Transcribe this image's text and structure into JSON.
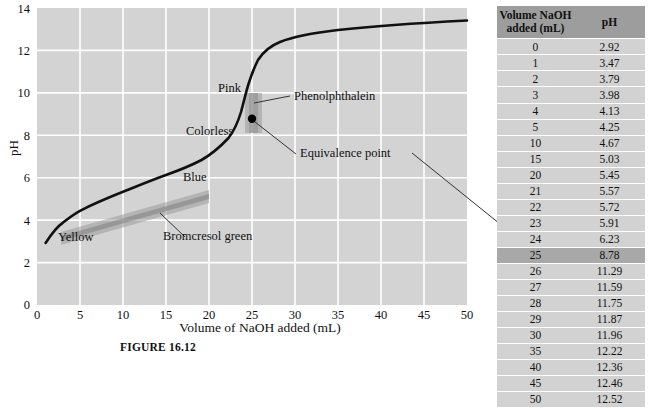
{
  "figure": {
    "caption": "FIGURE 16.12",
    "x_axis_title": "Volume of NaOH added (mL)",
    "y_axis_title": "pH"
  },
  "annotations": {
    "yellow": "Yellow",
    "blue": "Blue",
    "pink": "Pink",
    "colorless": "Colorless",
    "bromcresol_green": "Bromcresol green",
    "phenolphthalein": "Phenolphthalein",
    "equivalence_point": "Equivalence point"
  },
  "table": {
    "headers": [
      "Volume NaOH added (mL)",
      "pH"
    ],
    "header_line1": "Volume NaOH",
    "header_line2": "added (mL)",
    "header_ph": "pH",
    "highlight_volume": 25,
    "rows": [
      {
        "volume": "0",
        "ph": "2.92"
      },
      {
        "volume": "1",
        "ph": "3.47"
      },
      {
        "volume": "2",
        "ph": "3.79"
      },
      {
        "volume": "3",
        "ph": "3.98"
      },
      {
        "volume": "4",
        "ph": "4.13"
      },
      {
        "volume": "5",
        "ph": "4.25"
      },
      {
        "volume": "10",
        "ph": "4.67"
      },
      {
        "volume": "15",
        "ph": "5.03"
      },
      {
        "volume": "20",
        "ph": "5.45"
      },
      {
        "volume": "21",
        "ph": "5.57"
      },
      {
        "volume": "22",
        "ph": "5.72"
      },
      {
        "volume": "23",
        "ph": "5.91"
      },
      {
        "volume": "24",
        "ph": "6.23"
      },
      {
        "volume": "25",
        "ph": "8.78"
      },
      {
        "volume": "26",
        "ph": "11.29"
      },
      {
        "volume": "27",
        "ph": "11.59"
      },
      {
        "volume": "28",
        "ph": "11.75"
      },
      {
        "volume": "29",
        "ph": "11.87"
      },
      {
        "volume": "30",
        "ph": "11.96"
      },
      {
        "volume": "35",
        "ph": "12.22"
      },
      {
        "volume": "40",
        "ph": "12.36"
      },
      {
        "volume": "45",
        "ph": "12.46"
      },
      {
        "volume": "50",
        "ph": "12.52"
      }
    ]
  },
  "colors": {
    "plot_background": "#d3d3d3",
    "gridline": "#ffffff",
    "curve": "#000000",
    "indicator_band": "#9a9a9a",
    "table_header_bg": "#9d9d9d",
    "table_row_bg": "#d2d2d2",
    "table_highlight_bg": "#a8a8a8"
  },
  "chart_data": {
    "type": "line",
    "title": "",
    "xlabel": "Volume of NaOH added (mL)",
    "ylabel": "pH",
    "xlim": [
      0,
      50
    ],
    "ylim": [
      0,
      14
    ],
    "xticks": [
      0,
      5,
      10,
      15,
      20,
      25,
      30,
      35,
      40,
      45,
      50
    ],
    "yticks": [
      0,
      2,
      4,
      6,
      8,
      10,
      12,
      14
    ],
    "grid": true,
    "legend": "none",
    "series": [
      {
        "name": "Titration curve of weak acid with NaOH",
        "x": [
          0,
          1,
          2,
          3,
          4,
          5,
          10,
          15,
          20,
          21,
          22,
          23,
          24,
          25,
          26,
          27,
          28,
          29,
          30,
          35,
          40,
          45,
          50
        ],
        "y": [
          2.92,
          3.47,
          3.79,
          3.98,
          4.13,
          4.25,
          4.67,
          5.03,
          5.45,
          5.57,
          5.72,
          5.91,
          6.23,
          8.78,
          11.29,
          11.59,
          11.75,
          11.87,
          11.96,
          12.22,
          12.36,
          12.46,
          12.52
        ]
      }
    ],
    "markers": [
      {
        "label": "Equivalence point",
        "x": 25,
        "y": 8.78
      }
    ],
    "indicator_bands": [
      {
        "name": "Bromcresol green",
        "x_range": [
          3,
          20
        ],
        "ph_range": [
          3.8,
          5.4
        ],
        "orientation": "diagonal"
      },
      {
        "name": "Phenolphthalein",
        "x_range": [
          24.3,
          25.5
        ],
        "ph_range": [
          8.2,
          10.0
        ],
        "orientation": "vertical"
      }
    ]
  }
}
